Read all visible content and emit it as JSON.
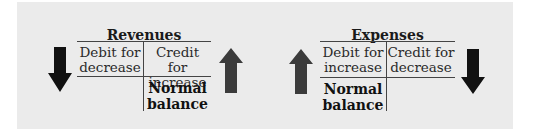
{
  "colors": {
    "panel_bg": "#ebebeb",
    "arrow_up": "#3b3b3b",
    "arrow_down": "#111111",
    "rule": "#444444"
  },
  "revenues": {
    "title": "Revenues",
    "debit_line1": "Debit for",
    "debit_line2": "decrease",
    "credit_line1": "Credit for",
    "credit_line2": "increase",
    "normal_line1": "Normal",
    "normal_line2": "balance",
    "normal_side": "credit",
    "left_arrow": "arrow-down-icon",
    "right_arrow": "arrow-up-icon"
  },
  "expenses": {
    "title": "Expenses",
    "debit_line1": "Debit for",
    "debit_line2": "increase",
    "credit_line1": "Credit for",
    "credit_line2": "decrease",
    "normal_line1": "Normal",
    "normal_line2": "balance",
    "normal_side": "debit",
    "left_arrow": "arrow-up-icon",
    "right_arrow": "arrow-down-icon"
  }
}
